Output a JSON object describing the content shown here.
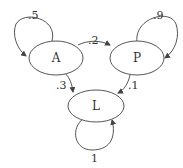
{
  "diagram": {
    "type": "state-transition",
    "nodes": [
      {
        "id": "A",
        "label": "A"
      },
      {
        "id": "P",
        "label": "P"
      },
      {
        "id": "L",
        "label": "L"
      }
    ],
    "edges": [
      {
        "from": "A",
        "to": "A",
        "label": ".5"
      },
      {
        "from": "A",
        "to": "P",
        "label": ".2"
      },
      {
        "from": "A",
        "to": "L",
        "label": ".3"
      },
      {
        "from": "P",
        "to": "P",
        "label": ".9"
      },
      {
        "from": "P",
        "to": "L",
        "label": ".1"
      },
      {
        "from": "L",
        "to": "L",
        "label": "1"
      }
    ]
  }
}
